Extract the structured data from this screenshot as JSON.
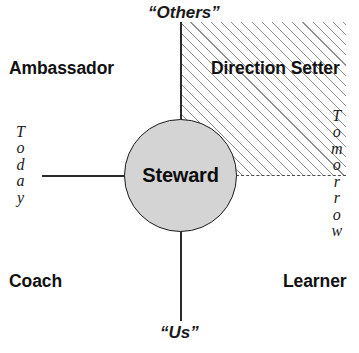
{
  "diagram": {
    "center": {
      "label": "Steward",
      "fill_color": "#d4d4d4",
      "border_color": "#1b1b1b"
    },
    "axes": {
      "vertical": {
        "top_label": "“Others”",
        "bottom_label": "“Us”"
      },
      "horizontal": {
        "left_label": "Today",
        "left_letters": [
          "T",
          "o",
          "d",
          "a",
          "y"
        ],
        "right_label": "Tomorrow",
        "right_letters": [
          "T",
          "o",
          "m",
          "o",
          "r",
          "r",
          "o",
          "w"
        ]
      }
    },
    "quadrants": {
      "top_left": "Ambassador",
      "top_right": "Direction Setter",
      "bottom_left": "Coach",
      "bottom_right": "Learner"
    },
    "highlight": {
      "quadrant": "top_right",
      "pattern": "diagonal-hatch",
      "hatch_color": "#8d8d8d"
    }
  }
}
